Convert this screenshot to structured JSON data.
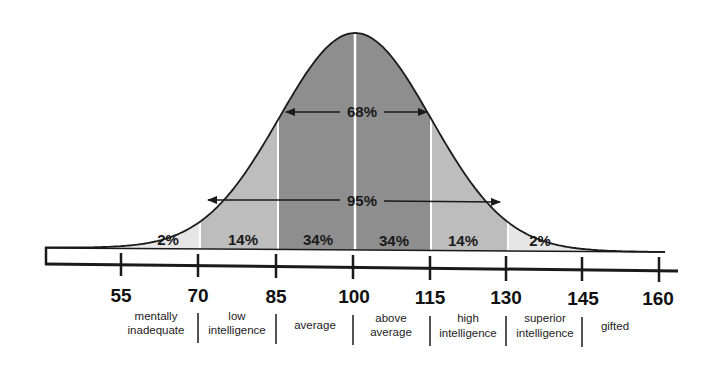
{
  "chart_data": {
    "type": "area",
    "title": "",
    "xlabel": "",
    "ylabel": "",
    "x_ticks": [
      55,
      70,
      85,
      100,
      115,
      130,
      145,
      160
    ],
    "xlim": [
      45,
      160
    ],
    "grid": false,
    "legend": null,
    "regions": [
      {
        "range": [
          55,
          70
        ],
        "percent": "2%",
        "fill": "#e6e6e6"
      },
      {
        "range": [
          70,
          85
        ],
        "percent": "14%",
        "fill": "#bdbdbd"
      },
      {
        "range": [
          85,
          100
        ],
        "percent": "34%",
        "fill": "#8e8e8e"
      },
      {
        "range": [
          100,
          115
        ],
        "percent": "34%",
        "fill": "#8e8e8e"
      },
      {
        "range": [
          115,
          130
        ],
        "percent": "14%",
        "fill": "#bdbdbd"
      },
      {
        "range": [
          130,
          145
        ],
        "percent": "2%",
        "fill": "#e6e6e6"
      }
    ],
    "annotations": [
      {
        "label": "68%",
        "range": [
          85,
          115
        ]
      },
      {
        "label": "95%",
        "range": [
          70,
          130
        ]
      }
    ],
    "categories": [
      {
        "range": [
          55,
          70
        ],
        "label_lines": [
          "mentally",
          "inadequate"
        ]
      },
      {
        "range": [
          70,
          85
        ],
        "label_lines": [
          "low",
          "intelligence"
        ]
      },
      {
        "range": [
          85,
          100
        ],
        "label_lines": [
          "average"
        ]
      },
      {
        "range": [
          100,
          115
        ],
        "label_lines": [
          "above",
          "average"
        ]
      },
      {
        "range": [
          115,
          130
        ],
        "label_lines": [
          "high",
          "intelligence"
        ]
      },
      {
        "range": [
          130,
          145
        ],
        "label_lines": [
          "superior",
          "intelligence"
        ]
      },
      {
        "range": [
          145,
          160
        ],
        "label_lines": [
          "gifted"
        ]
      }
    ]
  },
  "labels": {
    "pct": [
      "2%",
      "14%",
      "34%",
      "34%",
      "14%",
      "2%"
    ],
    "ticks": [
      "55",
      "70",
      "85",
      "100",
      "115",
      "130",
      "145",
      "160"
    ],
    "arrow_68": "68%",
    "arrow_95": "95%",
    "cat": {
      "c0a": "mentally",
      "c0b": "inadequate",
      "c1a": "low",
      "c1b": "intelligence",
      "c2": "average",
      "c3a": "above",
      "c3b": "average",
      "c4a": "high",
      "c4b": "intelligence",
      "c5a": "superior",
      "c5b": "intelligence",
      "c6": "gifted"
    }
  },
  "colors": {
    "tail": "#e6e6e6",
    "mid": "#bdbdbd",
    "center": "#8e8e8e",
    "line": "#1a1a1a"
  }
}
